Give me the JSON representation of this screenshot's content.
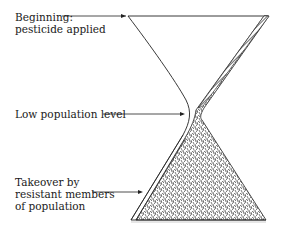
{
  "diagram": {
    "title": "",
    "labels": {
      "beginning": "Beginning:\npesticide applied",
      "low": "Low population level",
      "takeover": "Takeover by\nresistant members\nof population"
    },
    "colors": {
      "stroke": "#222222",
      "fill_dark": "#444444",
      "fill_light": "#bbbbbb",
      "background": "#ffffff"
    }
  }
}
